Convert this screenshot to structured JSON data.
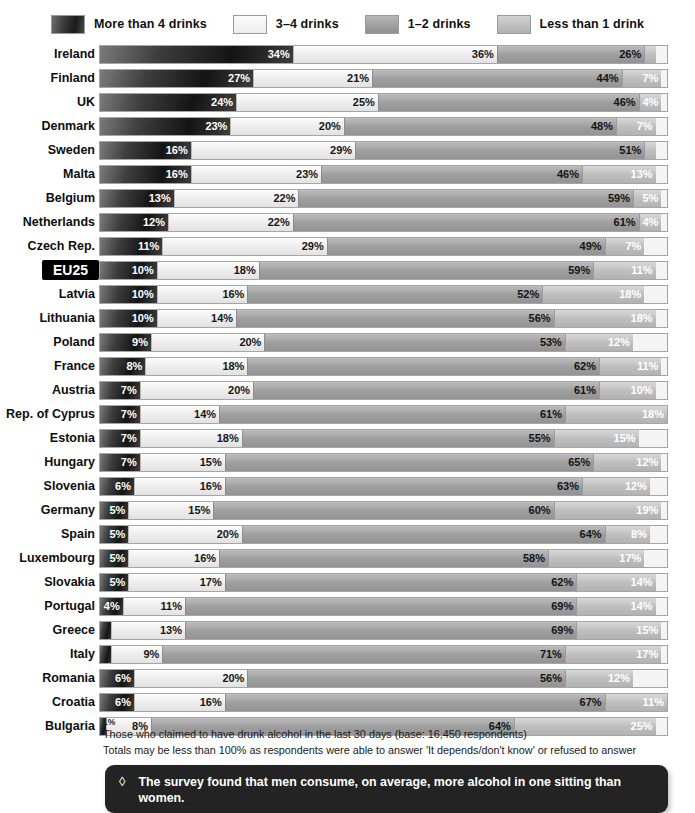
{
  "legend": {
    "items": [
      {
        "label": "More than 4 drinks",
        "swatch": "dark-gradient-swatch",
        "color": "#1a1a1a"
      },
      {
        "label": "3–4 drinks",
        "swatch": "lightest-swatch",
        "color": "#ededed"
      },
      {
        "label": "1–2 drinks",
        "swatch": "medium-gray-swatch",
        "color": "#9d9d9d"
      },
      {
        "label": "Less than 1 drink",
        "swatch": "light-gray-swatch",
        "color": "#bdbdbd"
      }
    ]
  },
  "chart_data": {
    "type": "bar",
    "orientation": "horizontal",
    "stacked": true,
    "title": "",
    "xlabel": "",
    "ylabel": "",
    "xlim": [
      0,
      100
    ],
    "grid": false,
    "legend_position": "top",
    "series": [
      {
        "name": "More than 4 drinks"
      },
      {
        "name": "3–4 drinks"
      },
      {
        "name": "1–2 drinks"
      },
      {
        "name": "Less than 1 drink"
      }
    ],
    "categories": [
      "Ireland",
      "Finland",
      "UK",
      "Denmark",
      "Sweden",
      "Malta",
      "Belgium",
      "Netherlands",
      "Czech Rep.",
      "EU25",
      "Latvia",
      "Lithuania",
      "Poland",
      "France",
      "Austria",
      "Rep. of Cyprus",
      "Estonia",
      "Hungary",
      "Slovenia",
      "Germany",
      "Spain",
      "Luxembourg",
      "Slovakia",
      "Portugal",
      "Greece",
      "Italy",
      "Romania",
      "Croatia",
      "Bulgaria"
    ],
    "rows": [
      {
        "label": "Ireland",
        "highlight": false,
        "values": [
          34,
          36,
          26,
          2
        ],
        "labels": [
          "34%",
          "36%",
          "26%",
          "2%"
        ]
      },
      {
        "label": "Finland",
        "highlight": false,
        "values": [
          27,
          21,
          44,
          7
        ],
        "labels": [
          "27%",
          "21%",
          "44%",
          "7%"
        ]
      },
      {
        "label": "UK",
        "highlight": false,
        "values": [
          24,
          25,
          46,
          4
        ],
        "labels": [
          "24%",
          "25%",
          "46%",
          "4%"
        ]
      },
      {
        "label": "Denmark",
        "highlight": false,
        "values": [
          23,
          20,
          48,
          7
        ],
        "labels": [
          "23%",
          "20%",
          "48%",
          "7%"
        ]
      },
      {
        "label": "Sweden",
        "highlight": false,
        "values": [
          16,
          29,
          51,
          2
        ],
        "labels": [
          "16%",
          "29%",
          "51%",
          "2%"
        ]
      },
      {
        "label": "Malta",
        "highlight": false,
        "values": [
          16,
          23,
          46,
          13
        ],
        "labels": [
          "16%",
          "23%",
          "46%",
          "13%"
        ]
      },
      {
        "label": "Belgium",
        "highlight": false,
        "values": [
          13,
          22,
          59,
          5
        ],
        "labels": [
          "13%",
          "22%",
          "59%",
          "5%"
        ]
      },
      {
        "label": "Netherlands",
        "highlight": false,
        "values": [
          12,
          22,
          61,
          4
        ],
        "labels": [
          "12%",
          "22%",
          "61%",
          "4%"
        ]
      },
      {
        "label": "Czech Rep.",
        "highlight": false,
        "values": [
          11,
          29,
          49,
          7
        ],
        "labels": [
          "11%",
          "29%",
          "49%",
          "7%"
        ]
      },
      {
        "label": "EU25",
        "highlight": true,
        "values": [
          10,
          18,
          59,
          11
        ],
        "labels": [
          "10%",
          "18%",
          "59%",
          "11%"
        ]
      },
      {
        "label": "Latvia",
        "highlight": false,
        "values": [
          10,
          16,
          52,
          18
        ],
        "labels": [
          "10%",
          "16%",
          "52%",
          "18%"
        ]
      },
      {
        "label": "Lithuania",
        "highlight": false,
        "values": [
          10,
          14,
          56,
          18
        ],
        "labels": [
          "10%",
          "14%",
          "56%",
          "18%"
        ]
      },
      {
        "label": "Poland",
        "highlight": false,
        "values": [
          9,
          20,
          53,
          12
        ],
        "labels": [
          "9%",
          "20%",
          "53%",
          "12%"
        ]
      },
      {
        "label": "France",
        "highlight": false,
        "values": [
          8,
          18,
          62,
          11
        ],
        "labels": [
          "8%",
          "18%",
          "62%",
          "11%"
        ]
      },
      {
        "label": "Austria",
        "highlight": false,
        "values": [
          7,
          20,
          61,
          10
        ],
        "labels": [
          "7%",
          "20%",
          "61%",
          "10%"
        ]
      },
      {
        "label": "Rep. of Cyprus",
        "highlight": false,
        "values": [
          7,
          14,
          61,
          18
        ],
        "labels": [
          "7%",
          "14%",
          "61%",
          "18%"
        ]
      },
      {
        "label": "Estonia",
        "highlight": false,
        "values": [
          7,
          18,
          55,
          15
        ],
        "labels": [
          "7%",
          "18%",
          "55%",
          "15%"
        ]
      },
      {
        "label": "Hungary",
        "highlight": false,
        "values": [
          7,
          15,
          65,
          12
        ],
        "labels": [
          "7%",
          "15%",
          "65%",
          "12%"
        ]
      },
      {
        "label": "Slovenia",
        "highlight": false,
        "values": [
          6,
          16,
          63,
          12
        ],
        "labels": [
          "6%",
          "16%",
          "63%",
          "12%"
        ]
      },
      {
        "label": "Germany",
        "highlight": false,
        "values": [
          5,
          15,
          60,
          19
        ],
        "labels": [
          "5%",
          "15%",
          "60%",
          "19%"
        ]
      },
      {
        "label": "Spain",
        "highlight": false,
        "values": [
          5,
          20,
          64,
          8
        ],
        "labels": [
          "5%",
          "20%",
          "64%",
          "8%"
        ]
      },
      {
        "label": "Luxembourg",
        "highlight": false,
        "values": [
          5,
          16,
          58,
          17
        ],
        "labels": [
          "5%",
          "16%",
          "58%",
          "17%"
        ]
      },
      {
        "label": "Slovakia",
        "highlight": false,
        "values": [
          5,
          17,
          62,
          14
        ],
        "labels": [
          "5%",
          "17%",
          "62%",
          "14%"
        ]
      },
      {
        "label": "Portugal",
        "highlight": false,
        "values": [
          4,
          11,
          69,
          14
        ],
        "labels": [
          "4%",
          "11%",
          "69%",
          "14%"
        ]
      },
      {
        "label": "Greece",
        "highlight": false,
        "values": [
          2,
          13,
          69,
          15
        ],
        "labels": [
          "2%",
          "13%",
          "69%",
          "15%"
        ]
      },
      {
        "label": "Italy",
        "highlight": false,
        "values": [
          2,
          9,
          71,
          17
        ],
        "labels": [
          "2%",
          "9%",
          "71%",
          "17%"
        ]
      },
      {
        "label": "Romania",
        "highlight": false,
        "values": [
          6,
          20,
          56,
          12
        ],
        "labels": [
          "6%",
          "20%",
          "56%",
          "12%"
        ]
      },
      {
        "label": "Croatia",
        "highlight": false,
        "values": [
          6,
          16,
          67,
          11
        ],
        "labels": [
          "6%",
          "16%",
          "67%",
          "11%"
        ]
      },
      {
        "label": "Bulgaria",
        "highlight": false,
        "values": [
          1,
          8,
          64,
          25
        ],
        "labels": [
          "",
          "8%",
          "64%",
          "25%"
        ]
      }
    ]
  },
  "annotations": {
    "bulgaria_first_segment": "1%"
  },
  "footnotes": [
    "Those who claimed to have drunk alcohol in the last 30 days (base: 16,450 respondents)",
    "Totals may be less than 100% as respondents were able to answer 'It depends/don't know' or refused to answer"
  ],
  "callout": {
    "bullet": "◊",
    "text": "The survey found that men consume, on average, more alcohol in one sitting than women."
  }
}
